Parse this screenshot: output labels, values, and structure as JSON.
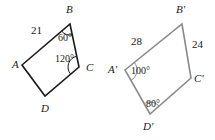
{
  "figure": {
    "background_color": "#ffffff",
    "shapes": [
      {
        "name": "quadrilateral-abcd",
        "stroke_color": "#1a1a1a",
        "stroke_width": 1.6,
        "vertices": [
          {
            "label": "A",
            "x": 22,
            "y": 65,
            "label_x": 12,
            "label_y": 68
          },
          {
            "label": "B",
            "x": 70,
            "y": 24,
            "label_x": 66,
            "label_y": 13
          },
          {
            "label": "C",
            "x": 79,
            "y": 67,
            "label_x": 86,
            "label_y": 71
          },
          {
            "label": "D",
            "x": 45,
            "y": 96,
            "label_x": 41,
            "label_y": 112
          }
        ],
        "side_labels": [
          {
            "text": "21",
            "x": 31,
            "y": 34
          }
        ],
        "angle_labels": [
          {
            "text": "60°",
            "x": 58,
            "y": 41,
            "at_vertex": "B"
          },
          {
            "text": "120°",
            "x": 55,
            "y": 62,
            "at_vertex": "C"
          }
        ],
        "angle_arcs": [
          {
            "at_vertex": "B",
            "radius": 11
          },
          {
            "at_vertex": "C",
            "radius": 11
          }
        ]
      },
      {
        "name": "quadrilateral-a-prime-b-prime-c-prime-d-prime",
        "stroke_color": "#8a8a8a",
        "stroke_width": 1.6,
        "vertices": [
          {
            "label": "A'",
            "x": 125,
            "y": 70,
            "label_x": 108,
            "label_y": 73
          },
          {
            "label": "B'",
            "x": 182,
            "y": 24,
            "label_x": 176,
            "label_y": 13
          },
          {
            "label": "C'",
            "x": 191,
            "y": 78,
            "label_x": 194,
            "label_y": 82
          },
          {
            "label": "D'",
            "x": 150,
            "y": 114,
            "label_x": 143,
            "label_y": 130
          }
        ],
        "side_labels": [
          {
            "text": "28",
            "x": 131,
            "y": 45
          },
          {
            "text": "24",
            "x": 192,
            "y": 48
          }
        ],
        "angle_labels": [
          {
            "text": "100°",
            "x": 131,
            "y": 74,
            "at_vertex": "A'"
          },
          {
            "text": "80°",
            "x": 146,
            "y": 107,
            "at_vertex": "D'"
          }
        ],
        "angle_arcs": [
          {
            "at_vertex": "A'",
            "radius": 12
          },
          {
            "at_vertex": "D'",
            "radius": 12
          }
        ]
      }
    ]
  }
}
